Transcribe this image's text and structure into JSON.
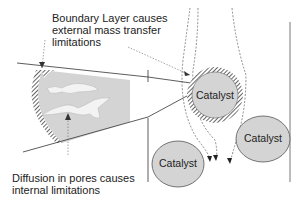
{
  "annotations": {
    "boundary_layer": {
      "line1": "Boundary Layer causes",
      "line2": "external mass transfer",
      "line3": "limitations"
    },
    "diffusion": {
      "line1": "Diffusion in pores causes",
      "line2": "internal limitations"
    }
  },
  "particles": [
    {
      "label": "Catalyst",
      "has_boundary_layer": true
    },
    {
      "label": "Catalyst",
      "has_boundary_layer": false
    },
    {
      "label": "Catalyst",
      "has_boundary_layer": false
    }
  ],
  "colors": {
    "particle_fill": "#d4d4d4",
    "outline": "#555555",
    "hatch": "#333333"
  }
}
